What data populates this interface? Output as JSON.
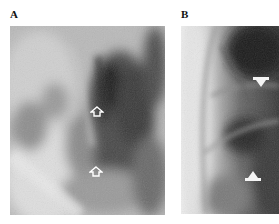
{
  "figure": {
    "panels": [
      {
        "label": "A",
        "description": "radiograph panel",
        "arrows": [
          {
            "style": "open",
            "direction": "up",
            "x": 97,
            "y": 112
          },
          {
            "style": "open",
            "direction": "up",
            "x": 96,
            "y": 172
          }
        ]
      },
      {
        "label": "B",
        "description": "radiograph panel",
        "arrows": [
          {
            "style": "solid",
            "direction": "down",
            "x": 261,
            "y": 82
          },
          {
            "style": "solid",
            "direction": "up",
            "x": 253,
            "y": 176
          }
        ]
      }
    ]
  }
}
